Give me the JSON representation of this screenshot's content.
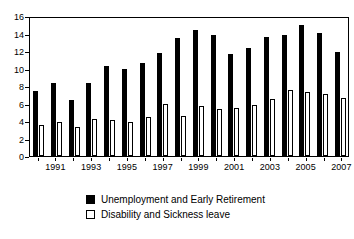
{
  "chart_data": {
    "type": "bar",
    "title": "",
    "subtitle": "",
    "xlabel": "",
    "ylabel": "",
    "ylim": [
      0,
      16
    ],
    "yticks": [
      0,
      2,
      4,
      6,
      8,
      10,
      12,
      14,
      16
    ],
    "grid": false,
    "legend_position": "bottom-center",
    "categories": [
      "1990",
      "1991",
      "1992",
      "1993",
      "1994",
      "1995",
      "1996",
      "1997",
      "1998",
      "1999",
      "2000",
      "2001",
      "2002",
      "2003",
      "2004",
      "2005",
      "2006",
      "2007"
    ],
    "tick_labels_shown": [
      "",
      "1991",
      "",
      "1993",
      "",
      "1995",
      "",
      "1997",
      "",
      "1999",
      "",
      "2001",
      "",
      "2003",
      "",
      "2005",
      "",
      "2007"
    ],
    "series": [
      {
        "name": "Unemployment and Early Retirement",
        "color": "#000000",
        "style": "filled",
        "values": [
          7.4,
          8.3,
          6.4,
          8.4,
          10.3,
          10.0,
          10.6,
          11.8,
          13.5,
          14.4,
          13.8,
          11.7,
          12.4,
          13.6,
          13.8,
          15.0,
          14.1,
          11.9
        ]
      },
      {
        "name": "Disability and Sickness leave",
        "color": "#ffffff",
        "style": "outlined",
        "values": [
          3.5,
          3.9,
          3.3,
          4.2,
          4.1,
          3.9,
          4.5,
          6.0,
          4.6,
          5.7,
          5.4,
          5.5,
          5.8,
          6.5,
          7.5,
          7.3,
          7.1,
          6.6
        ]
      }
    ]
  },
  "legend": {
    "items": [
      {
        "label": "Unemployment and Early Retirement",
        "swatch": "filled-black-square"
      },
      {
        "label": "Disability and Sickness leave",
        "swatch": "outlined-white-square"
      }
    ]
  }
}
